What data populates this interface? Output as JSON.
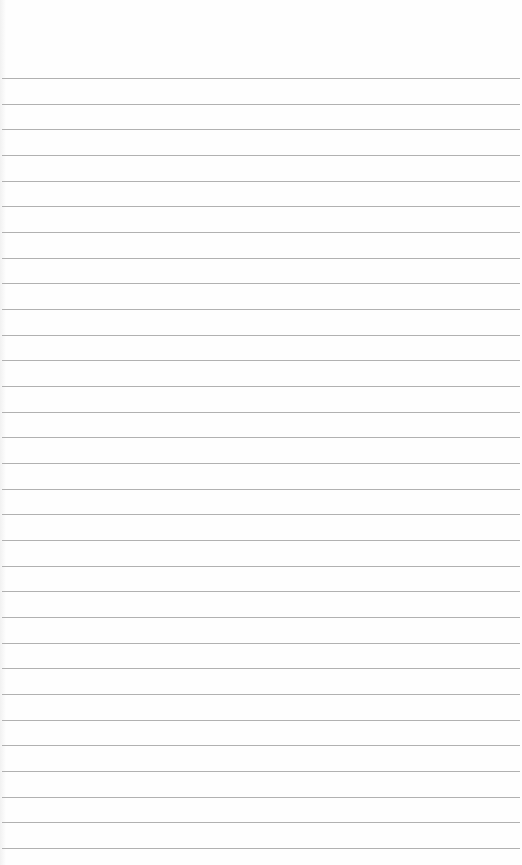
{
  "paper": {
    "type": "blank lined paper",
    "line_color": "#a9a9a9",
    "background_color": "#fefefe",
    "first_line_y": 78,
    "line_spacing": 25.67,
    "line_count": 31
  }
}
